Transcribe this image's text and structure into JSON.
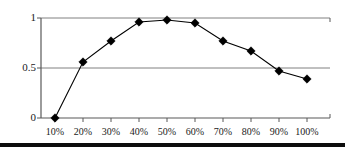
{
  "chart_data": {
    "type": "line",
    "title": "",
    "subtitle": "",
    "xlabel": "",
    "ylabel": "",
    "categories": [
      "10%",
      "20%",
      "30%",
      "40%",
      "50%",
      "60%",
      "70%",
      "80%",
      "90%",
      "100%"
    ],
    "x": [
      10,
      20,
      30,
      40,
      50,
      60,
      70,
      80,
      90,
      100
    ],
    "values": [
      0.0,
      0.56,
      0.77,
      0.96,
      0.98,
      0.95,
      0.77,
      0.67,
      0.47,
      0.39
    ],
    "series": [
      {
        "name": "",
        "values": [
          0.0,
          0.56,
          0.77,
          0.96,
          0.98,
          0.95,
          0.77,
          0.67,
          0.47,
          0.39
        ]
      }
    ],
    "ylim": [
      0,
      1
    ],
    "xlim": [
      10,
      100
    ],
    "y_ticks": [
      0,
      0.5,
      1
    ],
    "y_tick_labels": [
      "0",
      "0.5",
      "1"
    ],
    "x_tick_labels": [
      "10%",
      "20%",
      "30%",
      "40%",
      "50%",
      "60%",
      "70%",
      "80%",
      "90%",
      "100%"
    ],
    "grid": true,
    "gridlines_y": [
      0.5,
      1
    ],
    "legend": [],
    "legend_position": "none",
    "annotations": [],
    "marker": "diamond",
    "marker_color": "#000000",
    "line_color": "#000000",
    "grid_color": "#808080",
    "axis_color": "#595959"
  },
  "axes": {
    "y_labels": [
      {
        "text": "1",
        "value": 1
      },
      {
        "text": "0.5",
        "value": 0.5
      },
      {
        "text": "0",
        "value": 0
      }
    ],
    "x_labels": [
      {
        "text": "10%",
        "value": 10
      },
      {
        "text": "20%",
        "value": 20
      },
      {
        "text": "30%",
        "value": 30
      },
      {
        "text": "40%",
        "value": 40
      },
      {
        "text": "50%",
        "value": 50
      },
      {
        "text": "60%",
        "value": 60
      },
      {
        "text": "70%",
        "value": 70
      },
      {
        "text": "80%",
        "value": 80
      },
      {
        "text": "90%",
        "value": 90
      },
      {
        "text": "100%",
        "value": 100
      }
    ]
  }
}
